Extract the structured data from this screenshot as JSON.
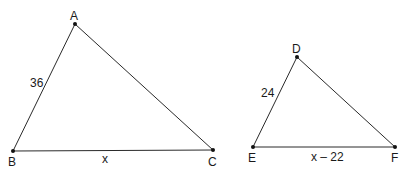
{
  "diagram": {
    "type": "similar-triangles",
    "triangles": [
      {
        "name": "ABC",
        "vertices": [
          {
            "label": "A",
            "x": 75,
            "y": 24
          },
          {
            "label": "B",
            "x": 13,
            "y": 151
          },
          {
            "label": "C",
            "x": 213,
            "y": 150
          }
        ],
        "side_labels": [
          {
            "side": "AB",
            "text": "36"
          },
          {
            "side": "BC",
            "text": "x"
          }
        ]
      },
      {
        "name": "DEF",
        "vertices": [
          {
            "label": "D",
            "x": 297,
            "y": 57
          },
          {
            "label": "E",
            "x": 253,
            "y": 147
          },
          {
            "label": "F",
            "x": 395,
            "y": 147
          }
        ],
        "side_labels": [
          {
            "side": "DE",
            "text": "24"
          },
          {
            "side": "EF",
            "text": "x – 22"
          }
        ]
      }
    ]
  }
}
